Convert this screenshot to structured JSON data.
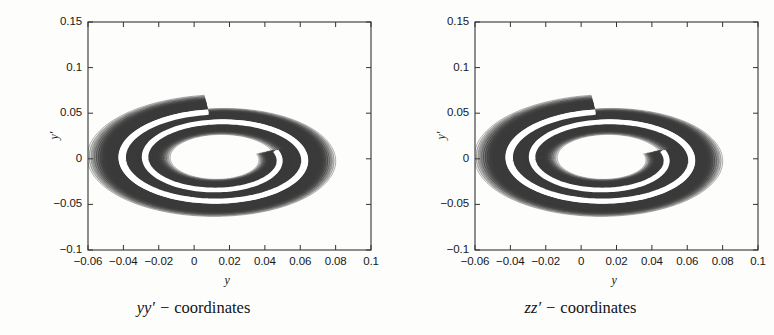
{
  "chart_data": [
    {
      "type": "scatter",
      "title": "yy' - coordinates",
      "panel_id": "left",
      "xlabel": "y",
      "ylabel": "y'",
      "xlim": [
        -0.06,
        0.1
      ],
      "ylim": [
        -0.1,
        0.15
      ],
      "xticks": [
        -0.06,
        -0.04,
        -0.02,
        0,
        0.02,
        0.04,
        0.06,
        0.08,
        0.1
      ],
      "xticklabels": [
        "−0.06",
        "−0.04",
        "−0.02",
        "0",
        "0.02",
        "0.04",
        "0.06",
        "0.08",
        "0.1"
      ],
      "yticks": [
        0.15,
        0.1,
        0.05,
        0,
        -0.05,
        -0.1
      ],
      "yticklabels": [
        "0.15",
        "0.1",
        "0.05",
        "0",
        "−0.05",
        "−0.1"
      ],
      "grid": false,
      "legend": "none",
      "tick_direction": "in",
      "box": true,
      "series": [
        {
          "name": "filamented phase-space spiral",
          "description": "Dense bundle of nested spiral contours forming a two-turn filamented distribution with a white separatrix gap and a sharp radial cut near y=0 at the top.",
          "n_filaments": 34,
          "turns": 1.78,
          "center": [
            0.014,
            0.0
          ],
          "color": "#3a3a3a",
          "gap_color": "#ffffff",
          "cut_angle_deg": 96,
          "outer_extent": {
            "x_max": 0.092,
            "x_min": -0.061,
            "y_max": 0.118,
            "y_min": -0.082
          },
          "inner_extent": {
            "x_max": 0.066,
            "x_min": -0.024,
            "y_max": 0.049,
            "y_min": -0.041
          }
        }
      ]
    },
    {
      "type": "scatter",
      "title": "zz' - coordinates",
      "panel_id": "right",
      "xlabel": "y",
      "ylabel": "y'",
      "xlim": [
        -0.06,
        0.1
      ],
      "ylim": [
        -0.1,
        0.15
      ],
      "xticks": [
        -0.06,
        -0.04,
        -0.02,
        0,
        0.02,
        0.04,
        0.06,
        0.08,
        0.1
      ],
      "xticklabels": [
        "−0.06",
        "−0.04",
        "−0.02",
        "0",
        "0.02",
        "0.04",
        "0.06",
        "0.08",
        "0.1"
      ],
      "yticks": [
        0.15,
        0.1,
        0.05,
        0,
        -0.05,
        -0.1
      ],
      "yticklabels": [
        "0.15",
        "0.1",
        "0.05",
        "0",
        "−0.05",
        "−0.1"
      ],
      "grid": false,
      "legend": "none",
      "tick_direction": "in",
      "box": true,
      "series": [
        {
          "name": "filamented phase-space spiral",
          "description": "Dense bundle of nested spiral contours forming a two-turn filamented distribution with a white separatrix gap and a sharp radial cut near y=0 at the top.",
          "n_filaments": 34,
          "turns": 1.78,
          "center": [
            0.014,
            0.0
          ],
          "color": "#3a3a3a",
          "gap_color": "#ffffff",
          "cut_angle_deg": 96,
          "outer_extent": {
            "x_max": 0.092,
            "x_min": -0.061,
            "y_max": 0.118,
            "y_min": -0.082
          },
          "inner_extent": {
            "x_max": 0.066,
            "x_min": -0.024,
            "y_max": 0.049,
            "y_min": -0.041
          }
        }
      ]
    }
  ],
  "panels": [
    {
      "id": "left",
      "caption_math": "yy′",
      "caption_dash": "−",
      "caption_word": "coordinates",
      "xlabel": "y",
      "ylabel": "y′",
      "xticklabels": [
        "−0.06",
        "−0.04",
        "−0.02",
        "0",
        "0.02",
        "0.04",
        "0.06",
        "0.08",
        "0.1"
      ],
      "yticklabels": [
        "0.15",
        "0.1",
        "0.05",
        "0",
        "−0.05",
        "−0.1"
      ]
    },
    {
      "id": "right",
      "caption_math": "zz′",
      "caption_dash": "−",
      "caption_word": "coordinates",
      "xlabel": "y",
      "ylabel": "y′",
      "xticklabels": [
        "−0.06",
        "−0.04",
        "−0.02",
        "0",
        "0.02",
        "0.04",
        "0.06",
        "0.08",
        "0.1"
      ],
      "yticklabels": [
        "0.15",
        "0.1",
        "0.05",
        "0",
        "−0.05",
        "−0.1"
      ]
    }
  ],
  "colors": {
    "background": "#fdfdfb",
    "axis": "#333333",
    "ink": "#16181a",
    "spiral": "#3a3a3a",
    "gap": "#ffffff"
  }
}
